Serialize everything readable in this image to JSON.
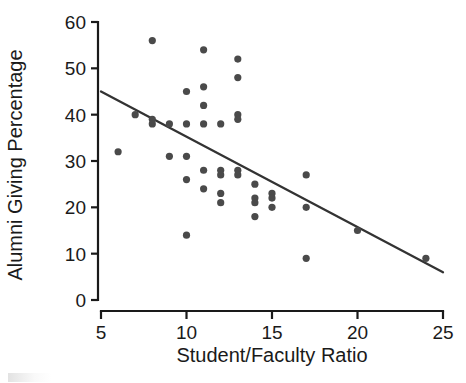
{
  "chart_data": {
    "type": "scatter",
    "title": "",
    "xlabel": "Student/Faculty Ratio",
    "ylabel": "Alumni Giving Percentage",
    "xlim": [
      5,
      25
    ],
    "ylim": [
      0,
      60
    ],
    "xticks": [
      5,
      10,
      15,
      20,
      25
    ],
    "yticks": [
      0,
      10,
      20,
      30,
      40,
      50,
      60
    ],
    "grid": false,
    "legend": null,
    "point_color": "#4a4a4a",
    "line_color": "#333333",
    "axis_color": "#1a1a1a",
    "points": [
      {
        "x": 6,
        "y": 32
      },
      {
        "x": 7,
        "y": 40
      },
      {
        "x": 8,
        "y": 56
      },
      {
        "x": 8,
        "y": 39
      },
      {
        "x": 8,
        "y": 38
      },
      {
        "x": 9,
        "y": 38
      },
      {
        "x": 9,
        "y": 31
      },
      {
        "x": 10,
        "y": 45
      },
      {
        "x": 10,
        "y": 38
      },
      {
        "x": 10,
        "y": 31
      },
      {
        "x": 10,
        "y": 26
      },
      {
        "x": 10,
        "y": 14
      },
      {
        "x": 11,
        "y": 54
      },
      {
        "x": 11,
        "y": 46
      },
      {
        "x": 11,
        "y": 42
      },
      {
        "x": 11,
        "y": 38
      },
      {
        "x": 11,
        "y": 28
      },
      {
        "x": 11,
        "y": 24
      },
      {
        "x": 12,
        "y": 38
      },
      {
        "x": 12,
        "y": 28
      },
      {
        "x": 12,
        "y": 27
      },
      {
        "x": 12,
        "y": 23
      },
      {
        "x": 12,
        "y": 21
      },
      {
        "x": 13,
        "y": 52
      },
      {
        "x": 13,
        "y": 48
      },
      {
        "x": 13,
        "y": 40
      },
      {
        "x": 13,
        "y": 39
      },
      {
        "x": 13,
        "y": 28
      },
      {
        "x": 13,
        "y": 27
      },
      {
        "x": 14,
        "y": 25
      },
      {
        "x": 14,
        "y": 22
      },
      {
        "x": 14,
        "y": 21
      },
      {
        "x": 14,
        "y": 18
      },
      {
        "x": 15,
        "y": 23
      },
      {
        "x": 15,
        "y": 22
      },
      {
        "x": 15,
        "y": 20
      },
      {
        "x": 17,
        "y": 27
      },
      {
        "x": 17,
        "y": 20
      },
      {
        "x": 17,
        "y": 9
      },
      {
        "x": 20,
        "y": 15
      },
      {
        "x": 24,
        "y": 9
      }
    ],
    "fit_line": {
      "x_start": 5,
      "y_start": 45,
      "x_end": 25,
      "y_end": 6
    },
    "annotations": []
  },
  "axis": {
    "x_tick_labels": [
      "5",
      "10",
      "15",
      "20",
      "25"
    ],
    "y_tick_labels": [
      "0",
      "10",
      "20",
      "30",
      "40",
      "50",
      "60"
    ],
    "x_title": "Student/Faculty Ratio",
    "y_title": "Alumni Giving Percentage"
  }
}
